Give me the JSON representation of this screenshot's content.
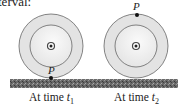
{
  "header_fragment": "terval:",
  "diagram": {
    "point_label": "P",
    "wheels": [
      {
        "id": "t1",
        "caption_prefix": "At time ",
        "time_var": "t",
        "time_sub": "1",
        "point_position": "bottom"
      },
      {
        "id": "t2",
        "caption_prefix": "At time ",
        "time_var": "t",
        "time_sub": "2",
        "point_position": "top"
      }
    ],
    "colors": {
      "wheel_outer_fill": "#e6e6e6",
      "wheel_inner_fill": "#f2f2f2",
      "wheel_stroke": "#555555",
      "ground": "#5a5a5a",
      "point": "#111111"
    }
  }
}
